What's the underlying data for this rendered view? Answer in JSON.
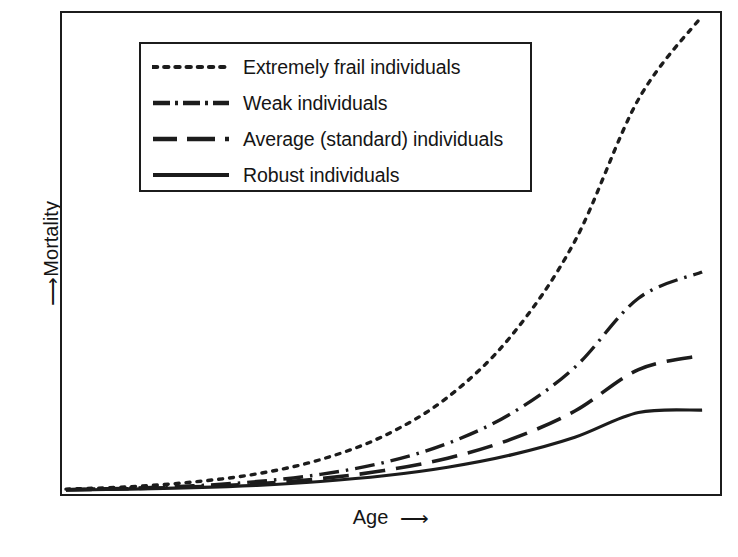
{
  "figure": {
    "background_color": "#ffffff",
    "line_color": "#1c1c1c",
    "frame": {
      "x": 60,
      "y": 11,
      "width": 662,
      "height": 485
    }
  },
  "axes": {
    "x_label": "Age",
    "x_arrow": "⟶",
    "y_label": "Mortality",
    "y_arrow": "⟶"
  },
  "legend": {
    "position": "top-left",
    "box": {
      "x": 77,
      "y": 29,
      "width": 393,
      "height": 150
    },
    "items": [
      {
        "label": "Extremely frail individuals",
        "style": "dotted"
      },
      {
        "label": "Weak individuals",
        "style": "dash-dot"
      },
      {
        "label": "Average (standard) individuals",
        "style": "dashed"
      },
      {
        "label": "Robust individuals",
        "style": "solid"
      }
    ]
  },
  "chart_data": {
    "type": "line",
    "title": "",
    "subtitle": "",
    "xlabel": "Age",
    "ylabel": "Mortality",
    "xlim": [
      0,
      100
    ],
    "ylim": [
      0,
      100
    ],
    "grid": false,
    "axis_ticks": false,
    "legend_position": "top-left",
    "annotations": [],
    "x": [
      0,
      10,
      20,
      30,
      40,
      50,
      60,
      70,
      80,
      90,
      100
    ],
    "series": [
      {
        "name": "Extremely frail individuals",
        "style": "dotted",
        "color": "#1c1c1c",
        "values": [
          0.4,
          0.9,
          1.9,
          3.6,
          6.6,
          11.6,
          19.7,
          32.6,
          52.5,
          82.3,
          99.8
        ]
      },
      {
        "name": "Weak individuals",
        "style": "dash-dot",
        "color": "#1c1c1c",
        "values": [
          0.3,
          0.6,
          1.1,
          2.0,
          3.5,
          6.0,
          10.0,
          16.3,
          26.0,
          40.5,
          46.0
        ]
      },
      {
        "name": "Average (standard) individuals",
        "style": "dashed",
        "color": "#1c1c1c",
        "values": [
          0.25,
          0.5,
          0.9,
          1.5,
          2.6,
          4.3,
          6.9,
          10.9,
          16.8,
          25.5,
          28.5
        ]
      },
      {
        "name": "Robust individuals",
        "style": "solid",
        "color": "#1c1c1c",
        "values": [
          0.2,
          0.4,
          0.7,
          1.2,
          2.0,
          3.2,
          5.0,
          7.6,
          11.3,
          16.5,
          17.0
        ]
      }
    ]
  }
}
